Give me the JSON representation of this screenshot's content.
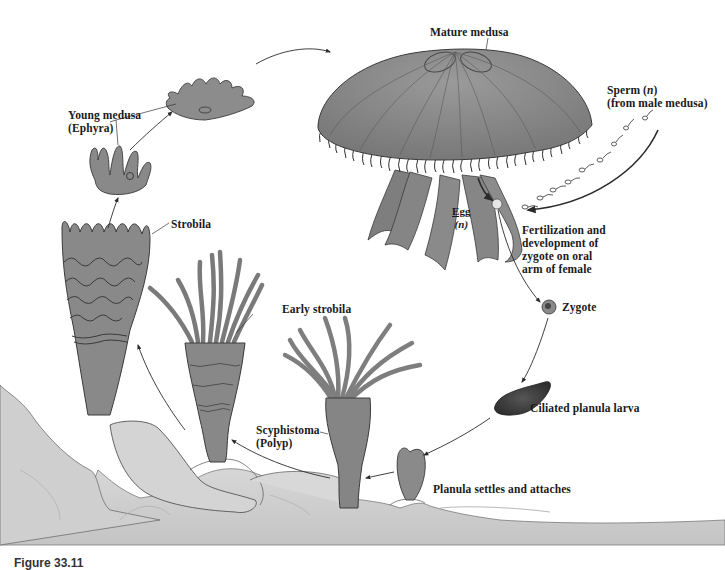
{
  "diagram": {
    "type": "life-cycle",
    "colors": {
      "organism_fill": "#8a8a8a",
      "organism_dark": "#5e5e5e",
      "rock_fill": "#d6d6d6",
      "rock_shadow": "#bcbcbc",
      "outline": "#3a3a3a",
      "arrow": "#2a2a2a",
      "background": "#ffffff"
    },
    "labels": {
      "mature_medusa": "Mature medusa",
      "sperm_line1": "Sperm (",
      "sperm_n": "n",
      "sperm_line1_end": ")",
      "sperm_line2": "(from male medusa)",
      "egg": "Egg",
      "egg_n": "(n)",
      "fertilization_lines": [
        "Fertilization and",
        "development of",
        "zygote on oral",
        "arm of female"
      ],
      "zygote": "Zygote",
      "planula_larva": "Ciliated planula larva",
      "planula_settles": "Planula settles and attaches",
      "scyphistoma_line1": "Scyphistoma",
      "scyphistoma_line2": "(Polyp)",
      "early_strobila": "Early strobila",
      "strobila": "Strobila",
      "young_medusa_line1": "Young medusa",
      "young_medusa_line2": "(Ephyra)"
    },
    "stages": [
      "Mature medusa",
      "Egg / Sperm",
      "Zygote",
      "Ciliated planula larva",
      "Planula settles and attaches",
      "Scyphistoma (Polyp)",
      "Early strobila",
      "Strobila",
      "Young medusa (Ephyra)"
    ],
    "caption": {
      "figure_label": "Figure 33.11",
      "text": "(caption text truncated at image bottom edge)"
    }
  }
}
